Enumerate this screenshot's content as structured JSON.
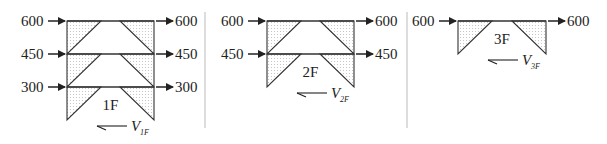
{
  "panels": [
    {
      "id": "panel-1f",
      "story_label": "1F",
      "shear_label": "V",
      "shear_sub": "1F",
      "levels": [
        {
          "left_force": "600",
          "right_force": "600"
        },
        {
          "left_force": "450",
          "right_force": "450"
        },
        {
          "left_force": "300",
          "right_force": "300"
        }
      ]
    },
    {
      "id": "panel-2f",
      "story_label": "2F",
      "shear_label": "V",
      "shear_sub": "2F",
      "levels": [
        {
          "left_force": "600",
          "right_force": "600"
        },
        {
          "left_force": "450",
          "right_force": "450"
        }
      ]
    },
    {
      "id": "panel-3f",
      "story_label": "3F",
      "shear_label": "V",
      "shear_sub": "3F",
      "levels": [
        {
          "left_force": "600",
          "right_force": "600"
        }
      ]
    }
  ],
  "colors": {
    "line": "#333333",
    "hatch_dot": "#8a8a8a",
    "divider": "#bbbbbb"
  }
}
